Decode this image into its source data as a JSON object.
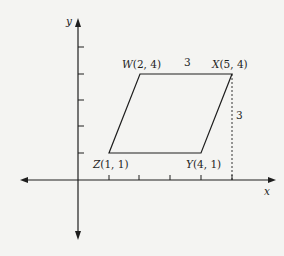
{
  "diagram": {
    "axes": {
      "x_label": "x",
      "y_label": "y",
      "origin_px": [
        78,
        180
      ],
      "unit_px": 30.7
    },
    "vertices": [
      {
        "name": "W",
        "label": "W(2, 4)",
        "x": 2,
        "y": 4
      },
      {
        "name": "X",
        "label": "X(5, 4)",
        "x": 5,
        "y": 4
      },
      {
        "name": "Y",
        "label": "Y(4, 1)",
        "x": 4,
        "y": 1
      },
      {
        "name": "Z",
        "label": "Z(1, 1)",
        "x": 1,
        "y": 1
      }
    ],
    "side_length_top": "3",
    "height_label": "3",
    "colors": {
      "line": "#1e1e1e",
      "background": "#f4f4f2"
    }
  }
}
